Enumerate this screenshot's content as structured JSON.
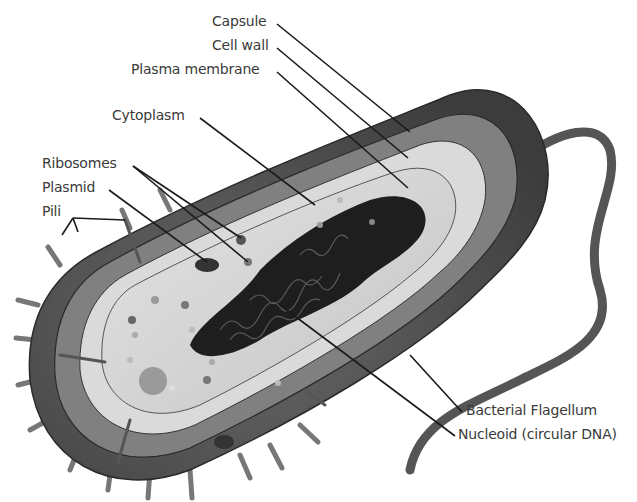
{
  "diagram": {
    "labels": {
      "capsule": "Capsule",
      "cell_wall": "Cell wall",
      "plasma_membrane": "Plasma membrane",
      "cytoplasm": "Cytoplasm",
      "ribosomes": "Ribosomes",
      "plasmid": "Plasmid",
      "pili": "Pili",
      "flagellum": "Bacterial Flagellum",
      "nucleoid": "Nucleoid (circular DNA)"
    },
    "colors": {
      "capsule": "#4a4a4a",
      "cell_wall": "#7a7a7a",
      "membrane_band": "#dcdcdc",
      "cytoplasm": "#d2d2d2",
      "nucleoid": "#1e1e1e",
      "leader_line": "#1a1a1a",
      "label_text": "#3a3a3a"
    }
  }
}
